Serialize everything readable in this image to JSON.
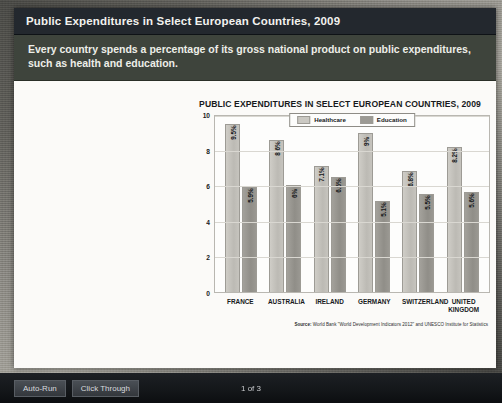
{
  "slide": {
    "title": "Public Expenditures in Select European Countries, 2009",
    "subtitle": "Every country spends a percentage of its gross national product on public expenditures, such as health and education."
  },
  "source": {
    "prefix": "Source:",
    "text": "World Bank \"World Development Indicators 2012\" and UNESCO Institute for Statistics"
  },
  "toolbar": {
    "auto_run": "Auto-Run",
    "click_through": "Click Through",
    "page_indicator": "1 of 3"
  },
  "colors": {
    "header_bg": "#23282e",
    "subtitle_bg": "#3e443c",
    "healthcare_bar": "#cbc9c3",
    "education_bar": "#9c9a94",
    "slide_bg": "#fbfaf8"
  },
  "chart_data": {
    "type": "bar",
    "title": "PUBLIC EXPENDITURES IN SELECT EUROPEAN COUNTRIES, 2009",
    "xlabel": "",
    "ylabel": "PERCENTAGE GNP",
    "ylim": [
      0,
      10
    ],
    "yticks": [
      10,
      8,
      6,
      4,
      2,
      0
    ],
    "grid": true,
    "legend_position": "top-center",
    "categories": [
      "FRANCE",
      "AUSTRALIA",
      "IRELAND",
      "GERMANY",
      "SWITZERLAND",
      "UNITED KINGDOM"
    ],
    "series": [
      {
        "name": "Healthcare",
        "values": [
          9.5,
          8.6,
          7.1,
          9.0,
          6.8,
          8.2
        ],
        "labels": [
          "9.5%",
          "8.6%",
          "7.1%",
          "9%",
          "6.8%",
          "8.2%"
        ]
      },
      {
        "name": "Education",
        "values": [
          5.9,
          6.0,
          6.5,
          5.1,
          5.5,
          5.6
        ],
        "labels": [
          "5.9%",
          "6%",
          "6.5%",
          "5.1%",
          "5.5%",
          "5.6%"
        ]
      }
    ]
  }
}
